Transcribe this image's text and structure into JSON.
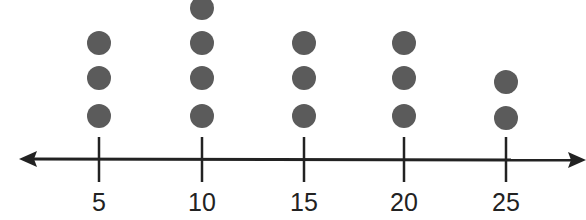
{
  "chart_data": {
    "type": "dot_plot",
    "title": "",
    "xlabel": "",
    "ylabel": "",
    "categories": [
      "5",
      "10",
      "15",
      "20",
      "25"
    ],
    "x": [
      5,
      10,
      15,
      20,
      25
    ],
    "values": [
      3,
      4,
      3,
      3,
      2
    ],
    "axis": {
      "arrows": "both",
      "grid": false
    },
    "colors": {
      "dot": "#5b5b5b",
      "axis": "#222222"
    }
  }
}
